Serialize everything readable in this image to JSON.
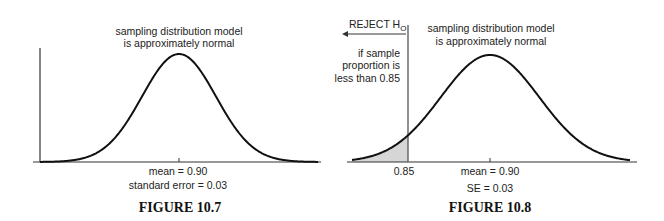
{
  "chart_data": [
    {
      "type": "line",
      "figure": "FIGURE 10.7",
      "title": [
        "sampling distribution model",
        "is approximately normal"
      ],
      "distribution": "normal",
      "mean": 0.9,
      "standard_error": 0.03,
      "x_labels": [
        "mean = 0.90",
        "standard error = 0.03"
      ],
      "grid": false
    },
    {
      "type": "line",
      "figure": "FIGURE 10.8",
      "title": [
        "sampling distribution model",
        "is approximately normal"
      ],
      "distribution": "normal",
      "mean": 0.9,
      "standard_error": 0.03,
      "cutoff": 0.85,
      "shaded_region": "left tail below 0.85",
      "annotation_reject": "REJECT H",
      "annotation_reject_sub": "O",
      "annotation_text": [
        "if sample",
        "proportion is",
        "less than 0.85"
      ],
      "x_labels": [
        "0.85",
        "mean = 0.90",
        "SE = 0.03"
      ],
      "grid": false
    }
  ],
  "fig1": {
    "title1": "sampling distribution model",
    "title2": "is approximately normal",
    "mean_label": "mean = 0.90",
    "se_label": "standard error = 0.03",
    "caption": "FIGURE 10.7"
  },
  "fig2": {
    "title1": "sampling distribution model",
    "title2": "is approximately normal",
    "reject": "REJECT H",
    "reject_sub": "O",
    "note1": "if sample",
    "note2": "proportion is",
    "note3": "less than 0.85",
    "cutoff_label": "0.85",
    "mean_label": "mean = 0.90",
    "se_label": "SE = 0.03",
    "caption": "FIGURE 10.8"
  }
}
